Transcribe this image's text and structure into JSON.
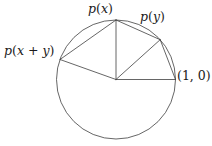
{
  "figure": {
    "kind": "unit-circle-chord-diagram",
    "width": 212,
    "height": 146,
    "background_color": "#ffffff",
    "stroke_color": "#3f3f3f",
    "text_color": "#1a1a1a",
    "stroke_width": 0.8
  },
  "geometry": {
    "circle": {
      "cx": 116,
      "cy": 79.5,
      "r": 59.5
    },
    "center_point": {
      "x": 116,
      "y": 79.5,
      "label": ""
    },
    "vertices": [
      {
        "name": "p-x-plus-y",
        "x": 60.0,
        "y": 59.5,
        "angle_deg": 160
      },
      {
        "name": "p-x",
        "x": 116.0,
        "y": 20.0,
        "angle_deg": 90
      },
      {
        "name": "p-y",
        "x": 160.2,
        "y": 39.7,
        "angle_deg": 42
      },
      {
        "name": "one-zero",
        "x": 175.5,
        "y": 79.5,
        "angle_deg": 0
      }
    ],
    "radii": [
      {
        "from": "center",
        "to": "p-x-plus-y"
      },
      {
        "from": "center",
        "to": "p-x"
      },
      {
        "from": "center",
        "to": "p-y"
      },
      {
        "from": "center",
        "to": "one-zero"
      }
    ],
    "chords": [
      {
        "from": "p-x-plus-y",
        "to": "p-x"
      },
      {
        "from": "p-x",
        "to": "p-y"
      },
      {
        "from": "p-y",
        "to": "one-zero"
      }
    ]
  },
  "labels": {
    "p_of_x": {
      "p": "p",
      "open": "(",
      "arg": "x",
      "close": ")"
    },
    "p_of_y": {
      "p": "p",
      "open": "(",
      "arg": "y",
      "close": ")"
    },
    "p_of_x_plus_y": {
      "p": "p",
      "open": "(",
      "arg1": "x",
      "plus": " + ",
      "arg2": "y",
      "close": ")"
    },
    "one_zero": {
      "open": "(",
      "first": "1",
      "comma": ", ",
      "second": "0",
      "close": ")"
    }
  }
}
